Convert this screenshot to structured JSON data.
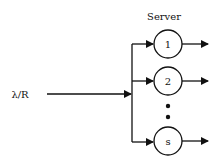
{
  "diagram": {
    "type": "multi-server queue",
    "title": "Server",
    "input_label": "λ/R",
    "servers": [
      {
        "label": "1"
      },
      {
        "label": "2"
      },
      {
        "label": "s"
      }
    ],
    "ellipsis": "⋮",
    "colors": {
      "stroke": "#111111",
      "background": "#ffffff"
    }
  }
}
